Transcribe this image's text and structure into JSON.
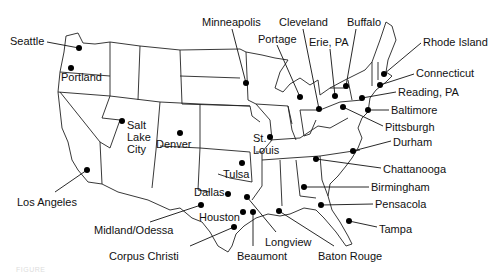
{
  "map": {
    "title": "United States city locations",
    "cities": [
      {
        "name": "Seattle",
        "lx": 10,
        "ly": 35,
        "dx": 79,
        "dy": 48
      },
      {
        "name": "Portland",
        "lx": 61,
        "ly": 71,
        "dx": 71,
        "dy": 68
      },
      {
        "name": "Salt\nLake\nCity",
        "lx": 127,
        "ly": 119,
        "dx": 122,
        "dy": 121
      },
      {
        "name": "Denver",
        "lx": 156,
        "ly": 138,
        "dx": 180,
        "dy": 133
      },
      {
        "name": "Minneapolis",
        "lx": 202,
        "ly": 16,
        "dx": 246,
        "dy": 83
      },
      {
        "name": "Portage",
        "lx": 258,
        "ly": 33,
        "dx": 300,
        "dy": 97
      },
      {
        "name": "Cleveland",
        "lx": 279,
        "ly": 16,
        "dx": 319,
        "dy": 109
      },
      {
        "name": "Erie, PA",
        "lx": 309,
        "ly": 36,
        "dx": 335,
        "dy": 96
      },
      {
        "name": "Buffalo",
        "lx": 347,
        "ly": 16,
        "dx": 346,
        "dy": 86
      },
      {
        "name": "Rhode Island",
        "lx": 423,
        "ly": 36,
        "dx": 384,
        "dy": 74
      },
      {
        "name": "Connecticut",
        "lx": 416,
        "ly": 67,
        "dx": 380,
        "dy": 85
      },
      {
        "name": "Reading, PA",
        "lx": 398,
        "ly": 86,
        "dx": 362,
        "dy": 98
      },
      {
        "name": "Baltimore",
        "lx": 391,
        "ly": 104,
        "dx": 368,
        "dy": 110
      },
      {
        "name": "Pittsburgh",
        "lx": 385,
        "ly": 121,
        "dx": 343,
        "dy": 107
      },
      {
        "name": "Durham",
        "lx": 393,
        "ly": 136,
        "dx": 353,
        "dy": 151
      },
      {
        "name": "Chattanooga",
        "lx": 383,
        "ly": 163,
        "dx": 316,
        "dy": 159
      },
      {
        "name": "Birmingham",
        "lx": 371,
        "ly": 181,
        "dx": 304,
        "dy": 187
      },
      {
        "name": "Pensacola",
        "lx": 375,
        "ly": 198,
        "dx": 321,
        "dy": 205
      },
      {
        "name": "Tampa",
        "lx": 379,
        "ly": 223,
        "dx": 349,
        "dy": 221
      },
      {
        "name": "St.\nLouis",
        "lx": 253,
        "ly": 132,
        "dx": 270,
        "dy": 137
      },
      {
        "name": "Tulsa",
        "lx": 223,
        "ly": 168,
        "dx": 242,
        "dy": 163
      },
      {
        "name": "Dallas",
        "lx": 194,
        "ly": 186,
        "dx": 228,
        "dy": 194
      },
      {
        "name": "Houston",
        "lx": 199,
        "ly": 211,
        "dx": 243,
        "dy": 212
      },
      {
        "name": "Midland/Odessa",
        "lx": 94,
        "ly": 224,
        "dx": 201,
        "dy": 205
      },
      {
        "name": "Los Angeles",
        "lx": 17,
        "ly": 196,
        "dx": 87,
        "dy": 170
      },
      {
        "name": "Corpus Christi",
        "lx": 109,
        "ly": 250,
        "dx": 234,
        "dy": 227
      },
      {
        "name": "Beaumont",
        "lx": 237,
        "ly": 250,
        "dx": 253,
        "dy": 212
      },
      {
        "name": "Longview",
        "lx": 265,
        "ly": 236,
        "dx": 247,
        "dy": 197
      },
      {
        "name": "Baton Rouge",
        "lx": 318,
        "ly": 250,
        "dx": 279,
        "dy": 211
      }
    ]
  },
  "leaders": [
    {
      "city": "Seattle",
      "x1": 47,
      "y1": 42,
      "x2": 79,
      "y2": 48
    },
    {
      "city": "Minneapolis",
      "x1": 232,
      "y1": 29,
      "x2": 246,
      "y2": 83
    },
    {
      "city": "Portage",
      "x1": 277,
      "y1": 45,
      "x2": 300,
      "y2": 97
    },
    {
      "city": "Cleveland",
      "x1": 303,
      "y1": 29,
      "x2": 319,
      "y2": 109
    },
    {
      "city": "Erie, PA",
      "x1": 330,
      "y1": 49,
      "x2": 335,
      "y2": 96
    },
    {
      "city": "Buffalo",
      "x1": 356,
      "y1": 29,
      "x2": 346,
      "y2": 86
    },
    {
      "city": "Rhode Island",
      "x1": 421,
      "y1": 43,
      "x2": 384,
      "y2": 74
    },
    {
      "city": "Connecticut",
      "x1": 414,
      "y1": 74,
      "x2": 380,
      "y2": 85
    },
    {
      "city": "Reading, PA",
      "x1": 396,
      "y1": 92,
      "x2": 362,
      "y2": 98
    },
    {
      "city": "Baltimore",
      "x1": 389,
      "y1": 110,
      "x2": 368,
      "y2": 110
    },
    {
      "city": "Pittsburgh",
      "x1": 383,
      "y1": 126,
      "x2": 343,
      "y2": 107
    },
    {
      "city": "Durham",
      "x1": 391,
      "y1": 141,
      "x2": 353,
      "y2": 151
    },
    {
      "city": "Chattanooga",
      "x1": 381,
      "y1": 168,
      "x2": 316,
      "y2": 159
    },
    {
      "city": "Birmingham",
      "x1": 369,
      "y1": 187,
      "x2": 304,
      "y2": 187
    },
    {
      "city": "Pensacola",
      "x1": 373,
      "y1": 204,
      "x2": 321,
      "y2": 205
    },
    {
      "city": "Tampa",
      "x1": 377,
      "y1": 227,
      "x2": 349,
      "y2": 221
    },
    {
      "city": "Los Angeles",
      "x1": 55,
      "y1": 192,
      "x2": 87,
      "y2": 170
    },
    {
      "city": "Midland/Odessa",
      "x1": 150,
      "y1": 222,
      "x2": 201,
      "y2": 205
    },
    {
      "city": "Corpus Christi",
      "x1": 190,
      "y1": 246,
      "x2": 234,
      "y2": 227
    },
    {
      "city": "Beaumont",
      "x1": 253,
      "y1": 246,
      "x2": 253,
      "y2": 212
    },
    {
      "city": "Longview",
      "x1": 276,
      "y1": 232,
      "x2": 247,
      "y2": 197
    },
    {
      "city": "Baton Rouge",
      "x1": 334,
      "y1": 246,
      "x2": 279,
      "y2": 211
    }
  ],
  "caption": "FIGURE"
}
